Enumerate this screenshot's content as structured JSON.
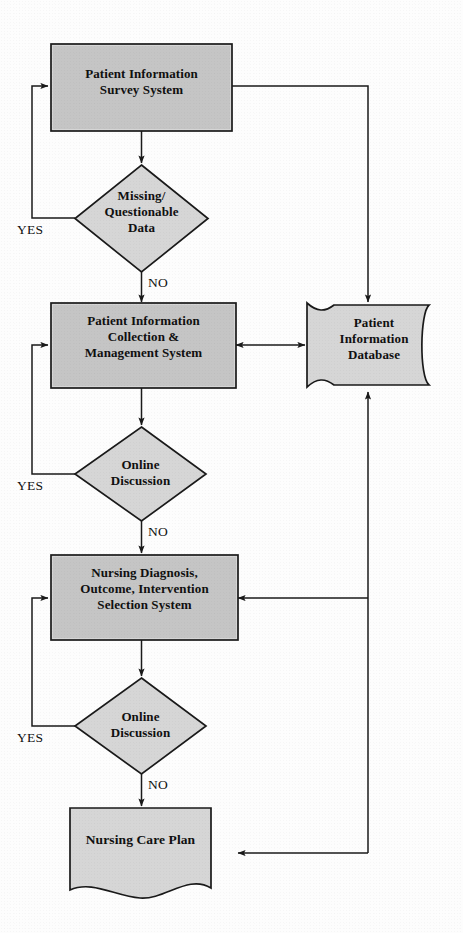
{
  "diagram": {
    "type": "flowchart",
    "colors": {
      "shape_fill": "#d6d6d6",
      "shape_stroke": "#1a1a1a",
      "connector": "#1a1a1a",
      "text": "#101010",
      "background": "#fdfdfd"
    },
    "nodes": [
      {
        "id": "survey-system",
        "shape": "process",
        "label": "Patient Information\nSurvey System",
        "lines": [
          "Patient Information",
          "Survey System"
        ]
      },
      {
        "id": "missing-data-decision",
        "shape": "decision",
        "label": "Missing/\nQuestionable\nData",
        "lines": [
          "Missing/",
          "Questionable",
          "Data"
        ]
      },
      {
        "id": "collection-management-system",
        "shape": "process",
        "label": "Patient Information\nCollection &\nManagement System",
        "lines": [
          "Patient Information",
          "Collection &",
          "Management System"
        ]
      },
      {
        "id": "patient-information-database",
        "shape": "database",
        "label": "Patient\nInformation\nDatabase",
        "lines": [
          "Patient",
          "Information",
          "Database"
        ]
      },
      {
        "id": "online-discussion-decision-1",
        "shape": "decision",
        "label": "Online\nDiscussion",
        "lines": [
          "Online",
          "Discussion"
        ]
      },
      {
        "id": "nursing-selection-system",
        "shape": "process",
        "label": "Nursing Diagnosis,\nOutcome, Intervention\nSelection System",
        "lines": [
          "Nursing Diagnosis,",
          "Outcome, Intervention",
          "Selection System"
        ]
      },
      {
        "id": "online-discussion-decision-2",
        "shape": "decision",
        "label": "Online\nDiscussion",
        "lines": [
          "Online",
          "Discussion"
        ]
      },
      {
        "id": "nursing-care-plan",
        "shape": "document",
        "label": "Nursing Care Plan",
        "lines": [
          "Nursing Care Plan"
        ]
      }
    ],
    "edge_labels": {
      "yes_1": "YES",
      "no_1": "NO",
      "yes_2": "YES",
      "no_2": "NO",
      "yes_3": "YES",
      "no_3": "NO"
    },
    "edges": [
      {
        "from": "survey-system",
        "to": "missing-data-decision",
        "label": ""
      },
      {
        "from": "missing-data-decision",
        "to": "survey-system",
        "label": "YES"
      },
      {
        "from": "missing-data-decision",
        "to": "collection-management-system",
        "label": "NO"
      },
      {
        "from": "survey-system",
        "to": "patient-information-database",
        "label": ""
      },
      {
        "from": "collection-management-system",
        "to": "patient-information-database",
        "label": "",
        "direction": "both"
      },
      {
        "from": "collection-management-system",
        "to": "online-discussion-decision-1",
        "label": ""
      },
      {
        "from": "online-discussion-decision-1",
        "to": "collection-management-system",
        "label": "YES"
      },
      {
        "from": "online-discussion-decision-1",
        "to": "nursing-selection-system",
        "label": "NO"
      },
      {
        "from": "patient-information-database",
        "to": "nursing-selection-system",
        "label": ""
      },
      {
        "from": "nursing-selection-system",
        "to": "online-discussion-decision-2",
        "label": ""
      },
      {
        "from": "online-discussion-decision-2",
        "to": "nursing-selection-system",
        "label": "YES"
      },
      {
        "from": "online-discussion-decision-2",
        "to": "nursing-care-plan",
        "label": "NO"
      },
      {
        "from": "patient-information-database",
        "to": "nursing-care-plan",
        "label": ""
      }
    ]
  }
}
